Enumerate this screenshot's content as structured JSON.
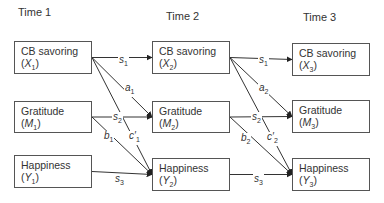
{
  "times": [
    {
      "label": "Time 1",
      "x": 18,
      "y": 6
    },
    {
      "label": "Time 2",
      "x": 166,
      "y": 10
    },
    {
      "label": "Time 3",
      "x": 303,
      "y": 11
    }
  ],
  "nodes": [
    {
      "id": "X1",
      "name": "CB savoring",
      "var": "X",
      "sub": "1",
      "x": 14,
      "y": 41,
      "w": 78,
      "h": 33
    },
    {
      "id": "M1",
      "name": "Gratitude",
      "var": "M",
      "sub": "1",
      "x": 14,
      "y": 101,
      "w": 78,
      "h": 32
    },
    {
      "id": "Y1",
      "name": "Happiness",
      "var": "Y",
      "sub": "1",
      "x": 14,
      "y": 155,
      "w": 78,
      "h": 33
    },
    {
      "id": "X2",
      "name": "CB savoring",
      "var": "X",
      "sub": "2",
      "x": 152,
      "y": 41,
      "w": 78,
      "h": 33
    },
    {
      "id": "M2",
      "name": "Gratitude",
      "var": "M",
      "sub": "2",
      "x": 152,
      "y": 101,
      "w": 78,
      "h": 32
    },
    {
      "id": "Y2",
      "name": "Happiness",
      "var": "Y",
      "sub": "2",
      "x": 152,
      "y": 158,
      "w": 78,
      "h": 33
    },
    {
      "id": "X3",
      "name": "CB savoring",
      "var": "X",
      "sub": "3",
      "x": 292,
      "y": 43,
      "w": 78,
      "h": 33
    },
    {
      "id": "M3",
      "name": "Gratitude",
      "var": "M",
      "sub": "3",
      "x": 292,
      "y": 100,
      "w": 78,
      "h": 33
    },
    {
      "id": "Y3",
      "name": "Happiness",
      "var": "Y",
      "sub": "3",
      "x": 292,
      "y": 158,
      "w": 78,
      "h": 33
    }
  ],
  "edges": [
    {
      "from": "X1",
      "to": "X2",
      "label": "s",
      "sub": "1",
      "lx": 118,
      "ly": 55
    },
    {
      "from": "X1",
      "to": "M2",
      "label": "a",
      "sub": "1",
      "lx": 124,
      "ly": 83
    },
    {
      "from": "M1",
      "to": "M2",
      "label": "s",
      "sub": "2",
      "lx": 112,
      "ly": 112
    },
    {
      "from": "X1",
      "to": "Y2",
      "label": "c′",
      "sub": "1",
      "lx": 128,
      "ly": 131
    },
    {
      "from": "M1",
      "to": "Y2",
      "label": "b",
      "sub": "1",
      "lx": 103,
      "ly": 131
    },
    {
      "from": "Y1",
      "to": "Y2",
      "label": "s",
      "sub": "3",
      "lx": 114,
      "ly": 174
    },
    {
      "from": "X2",
      "to": "X3",
      "label": "s",
      "sub": "1",
      "lx": 258,
      "ly": 55
    },
    {
      "from": "X2",
      "to": "M3",
      "label": "a",
      "sub": "2",
      "lx": 258,
      "ly": 83
    },
    {
      "from": "M2",
      "to": "M3",
      "label": "s",
      "sub": "2",
      "lx": 251,
      "ly": 112
    },
    {
      "from": "X2",
      "to": "Y3",
      "label": "c′",
      "sub": "2",
      "lx": 266,
      "ly": 132
    },
    {
      "from": "M2",
      "to": "Y3",
      "label": "b",
      "sub": "2",
      "lx": 240,
      "ly": 133
    },
    {
      "from": "Y2",
      "to": "Y3",
      "label": "s",
      "sub": "3",
      "lx": 253,
      "ly": 174
    }
  ],
  "colors": {
    "line": "#333333",
    "border": "#555555",
    "text": "#333333"
  }
}
